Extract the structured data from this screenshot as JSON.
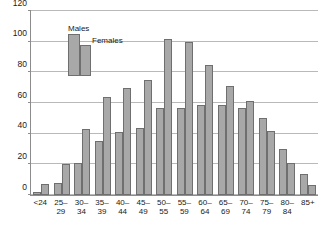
{
  "chart_data": {
    "type": "bar",
    "title": "",
    "xlabel": "",
    "ylabel": "",
    "ylim": [
      0,
      120
    ],
    "yticks": [
      0,
      20,
      40,
      60,
      80,
      100,
      120
    ],
    "ytick_labels": [
      "0",
      "20",
      "40",
      "60",
      "80",
      "100",
      "120"
    ],
    "grid": true,
    "legend_position": "top-left",
    "categories": [
      "<24",
      "25–\n29",
      "30–\n34",
      "35–\n39",
      "40–\n44",
      "45–\n49",
      "50–\n55",
      "55–\n59",
      "60–\n64",
      "65–\n69",
      "70–\n74",
      "75–\n79",
      "80–\n84",
      "85+"
    ],
    "series": [
      {
        "name": "Males",
        "color": "#a8a8a8",
        "values": [
          2,
          8,
          21,
          35,
          41,
          44,
          57,
          57,
          59,
          59,
          57,
          50,
          30,
          14
        ]
      },
      {
        "name": "Females",
        "color": "#a8a8a8",
        "values": [
          7,
          20,
          43,
          64,
          70,
          75,
          102,
          100,
          85,
          71,
          61,
          42,
          21,
          6.5
        ]
      }
    ]
  },
  "legend": {
    "males_label": "Males",
    "females_label": "Females"
  }
}
